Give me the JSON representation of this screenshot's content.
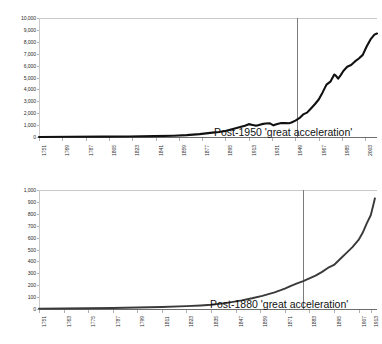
{
  "charts": [
    {
      "id": "top",
      "annotation": "Post-1950 'great acceleration'",
      "marker_year": 1950,
      "chart_data": {
        "type": "line",
        "title": "",
        "xlabel": "",
        "ylabel": "",
        "xlim": [
          1751,
          2012
        ],
        "ylim": [
          0,
          10000
        ],
        "grid": false,
        "legend": "none",
        "line_color": "#111111",
        "xticks": [
          1751,
          1769,
          1787,
          1805,
          1823,
          1841,
          1859,
          1877,
          1895,
          1913,
          1931,
          1949,
          1967,
          1985,
          2003
        ],
        "yticks": [
          0,
          1000,
          2000,
          3000,
          4000,
          5000,
          6000,
          7000,
          8000,
          9000,
          10000
        ],
        "ytick_labels": [
          "0",
          "1,000",
          "2,000",
          "3,000",
          "4,000",
          "5,000",
          "6,000",
          "7,000",
          "8,000",
          "9,000",
          "10,000"
        ],
        "x": [
          1751,
          1775,
          1800,
          1820,
          1840,
          1855,
          1865,
          1875,
          1885,
          1890,
          1895,
          1900,
          1905,
          1910,
          1913,
          1916,
          1918,
          1920,
          1923,
          1926,
          1929,
          1932,
          1935,
          1938,
          1941,
          1944,
          1946,
          1949,
          1952,
          1955,
          1958,
          1961,
          1964,
          1967,
          1970,
          1973,
          1976,
          1979,
          1980,
          1982,
          1984,
          1986,
          1989,
          1992,
          1995,
          1998,
          2001,
          2004,
          2007,
          2010,
          2012
        ],
        "y": [
          3,
          15,
          30,
          45,
          70,
          110,
          160,
          240,
          370,
          420,
          500,
          650,
          800,
          950,
          1080,
          1010,
          960,
          980,
          1080,
          1140,
          1160,
          980,
          1100,
          1170,
          1180,
          1160,
          1220,
          1380,
          1580,
          1900,
          2050,
          2400,
          2750,
          3150,
          3750,
          4400,
          4650,
          5250,
          5180,
          4900,
          5200,
          5550,
          5900,
          6050,
          6350,
          6600,
          6900,
          7600,
          8200,
          8600,
          8700
        ]
      }
    },
    {
      "id": "bottom",
      "annotation": "Post-1880 'great acceleration'",
      "marker_year": 1880,
      "chart_data": {
        "type": "line",
        "title": "",
        "xlabel": "",
        "ylabel": "",
        "xlim": [
          1751,
          1916
        ],
        "ylim": [
          0,
          1000
        ],
        "grid": false,
        "legend": "none",
        "line_color": "#3a3a3a",
        "xticks": [
          1751,
          1763,
          1775,
          1787,
          1799,
          1811,
          1823,
          1835,
          1847,
          1859,
          1871,
          1883,
          1895,
          1907,
          1913
        ],
        "yticks": [
          0,
          100,
          200,
          300,
          400,
          500,
          600,
          700,
          800,
          900,
          1000
        ],
        "ytick_labels": [
          "0",
          "100",
          "200",
          "300",
          "400",
          "500",
          "600",
          "700",
          "800",
          "900",
          "1,000"
        ],
        "x": [
          1751,
          1763,
          1775,
          1787,
          1799,
          1811,
          1823,
          1830,
          1835,
          1840,
          1845,
          1850,
          1855,
          1860,
          1863,
          1866,
          1869,
          1871,
          1874,
          1877,
          1880,
          1883,
          1886,
          1889,
          1892,
          1895,
          1898,
          1901,
          1904,
          1907,
          1909,
          1911,
          1913,
          1915
        ],
        "y": [
          3,
          4,
          6,
          9,
          12,
          17,
          24,
          30,
          36,
          45,
          58,
          72,
          90,
          110,
          125,
          140,
          158,
          172,
          195,
          215,
          235,
          258,
          280,
          310,
          345,
          370,
          420,
          470,
          520,
          580,
          640,
          720,
          790,
          930
        ]
      }
    }
  ]
}
